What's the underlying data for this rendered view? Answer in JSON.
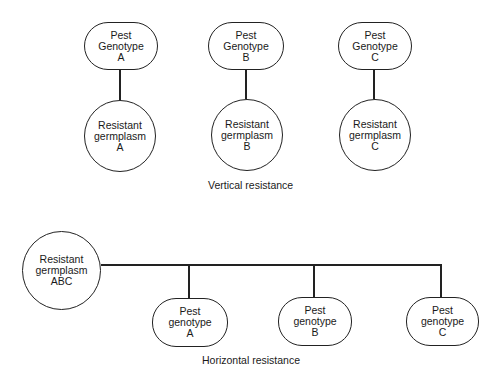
{
  "vertical": {
    "caption": "Vertical resistance",
    "pairs": [
      {
        "pest": {
          "line1": "Pest",
          "line2": "Genotype",
          "line3": "A"
        },
        "germplasm": {
          "line1": "Resistant",
          "line2": "germplasm",
          "line3": "A"
        }
      },
      {
        "pest": {
          "line1": "Pest",
          "line2": "Genotype",
          "line3": "B"
        },
        "germplasm": {
          "line1": "Resistant",
          "line2": "germplasm",
          "line3": "B"
        }
      },
      {
        "pest": {
          "line1": "Pest",
          "line2": "Genotype",
          "line3": "C"
        },
        "germplasm": {
          "line1": "Resistant",
          "line2": "germplasm",
          "line3": "C"
        }
      }
    ]
  },
  "horizontal": {
    "caption": "Horizontal resistance",
    "germplasm": {
      "line1": "Resistant",
      "line2": "germplasm",
      "line3": "ABC"
    },
    "pests": [
      {
        "line1": "Pest",
        "line2": "genotype",
        "line3": "A"
      },
      {
        "line1": "Pest",
        "line2": "genotype",
        "line3": "B"
      },
      {
        "line1": "Pest",
        "line2": "genotype",
        "line3": "C"
      }
    ]
  },
  "colors": {
    "stroke": "#222222",
    "text": "#1a1a1a",
    "background": "#ffffff"
  }
}
